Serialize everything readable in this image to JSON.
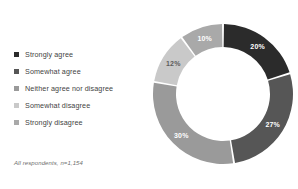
{
  "chart_data": {
    "type": "pie",
    "variant": "donut",
    "title": "",
    "subtitle": "",
    "xlabel": "",
    "ylabel": "",
    "legend_position": "left",
    "grid": false,
    "start_angle_deg": 0,
    "direction": "clockwise",
    "value_suffix": "%",
    "categories": [
      "Strongly agree",
      "Somewhat agree",
      "Neither agree nor disagree",
      "Somewhat disagree",
      "Strongly disagree"
    ],
    "values": [
      20,
      27,
      30,
      12,
      10
    ],
    "labels": [
      "20%",
      "27%",
      "30%",
      "12%",
      "10%"
    ],
    "colors": [
      "#2b2b2b",
      "#565656",
      "#9a9a9a",
      "#c9c9c9",
      "#a9a9a9"
    ],
    "label_colors": [
      "#ffffff",
      "#ffffff",
      "#ffffff",
      "#5c5c5c",
      "#ffffff"
    ],
    "annotation": "All respondents, n=1,154"
  },
  "legend": {
    "items": [
      {
        "label": "Strongly agree",
        "color": "#2b2b2b"
      },
      {
        "label": "Somewhat agree",
        "color": "#565656"
      },
      {
        "label": "Neither agree nor disagree",
        "color": "#9a9a9a"
      },
      {
        "label": "Somewhat disagree",
        "color": "#c9c9c9"
      },
      {
        "label": "Strongly disagree",
        "color": "#a9a9a9"
      }
    ]
  },
  "footnote": {
    "text": "All respondents, n=1,154"
  }
}
